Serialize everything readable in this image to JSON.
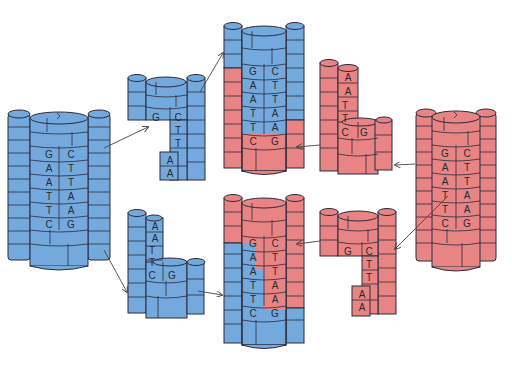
{
  "colors": {
    "parent_blue": "#74a9dd",
    "parent_red": "#e88484",
    "outline": "#2b2b3a",
    "arrow": "#444444",
    "background": "#ffffff"
  },
  "molecules": {
    "blue_parent": {
      "strand_left": [
        "G",
        "A",
        "A",
        "T",
        "T",
        "C"
      ],
      "strand_right": [
        "C",
        "T",
        "T",
        "A",
        "A",
        "G"
      ]
    },
    "blue_top_fragment": {
      "strand_left": [
        "G"
      ],
      "strand_right": [
        "C",
        "T",
        "T",
        "A",
        "A"
      ]
    },
    "blue_bottom_fragment": {
      "strand_left": [
        "A",
        "A",
        "T",
        "T",
        "C"
      ],
      "strand_right": [
        "G"
      ]
    },
    "recombinant_top": {
      "strand_left": [
        "G",
        "A",
        "A",
        "T",
        "T",
        "C"
      ],
      "strand_right": [
        "C",
        "T",
        "T",
        "A",
        "A",
        "G"
      ]
    },
    "recombinant_bottom": {
      "strand_left": [
        "G",
        "A",
        "A",
        "T",
        "T",
        "C"
      ],
      "strand_right": [
        "C",
        "T",
        "T",
        "A",
        "A",
        "G"
      ]
    },
    "red_top_fragment": {
      "strand_left": [
        "A",
        "A",
        "T",
        "T",
        "C"
      ],
      "strand_right": [
        "G"
      ]
    },
    "red_bottom_fragment": {
      "strand_left": [
        "G"
      ],
      "strand_right": [
        "C",
        "T",
        "T",
        "A",
        "A"
      ]
    },
    "red_parent": {
      "strand_left": [
        "G",
        "A",
        "A",
        "T",
        "T",
        "C"
      ],
      "strand_right": [
        "C",
        "T",
        "T",
        "A",
        "A",
        "G"
      ]
    }
  },
  "labels": {
    "bp": [
      "G",
      "A",
      "A",
      "T",
      "T",
      "C",
      "C",
      "T",
      "T",
      "A",
      "A",
      "G"
    ]
  }
}
